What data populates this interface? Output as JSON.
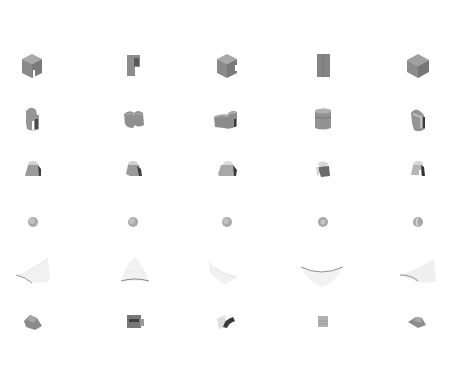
{
  "grid": {
    "rows": 6,
    "columns": 5,
    "column_centers": [
      32,
      133,
      227,
      323,
      418
    ],
    "row_centers": [
      66,
      120,
      170,
      222,
      272,
      322
    ],
    "background": "#ffffff"
  },
  "rows": [
    {
      "name": "notched-cube",
      "cells": [
        {
          "shape": "cube-notch",
          "view": "iso-left"
        },
        {
          "shape": "slab-notch",
          "view": "front"
        },
        {
          "shape": "cube-notch",
          "view": "iso-right"
        },
        {
          "shape": "slab",
          "view": "front-flat"
        },
        {
          "shape": "cube",
          "view": "iso"
        }
      ]
    },
    {
      "name": "rounded-block",
      "cells": [
        {
          "shape": "rounded-notch",
          "view": "side"
        },
        {
          "shape": "rounded-bowl",
          "view": "top"
        },
        {
          "shape": "rounded-wide",
          "view": "iso"
        },
        {
          "shape": "cylinder-block",
          "view": "front"
        },
        {
          "shape": "rounded-notch",
          "view": "side-right"
        }
      ]
    },
    {
      "name": "frustum-cap",
      "cells": [
        {
          "shape": "cap",
          "view": "left"
        },
        {
          "shape": "cap",
          "view": "front"
        },
        {
          "shape": "cap",
          "view": "right"
        },
        {
          "shape": "cap-dark",
          "view": "back"
        },
        {
          "shape": "cap",
          "view": "open"
        }
      ]
    },
    {
      "name": "sphere",
      "cells": [
        {
          "shape": "sphere"
        },
        {
          "shape": "sphere"
        },
        {
          "shape": "sphere"
        },
        {
          "shape": "sphere"
        },
        {
          "shape": "sphere-crescent"
        }
      ]
    },
    {
      "name": "point-cloud-sheet",
      "cells": [
        {
          "shape": "sheet",
          "view": "left"
        },
        {
          "shape": "sheet",
          "view": "front"
        },
        {
          "shape": "sheet",
          "view": "right"
        },
        {
          "shape": "sheet",
          "view": "bottom"
        },
        {
          "shape": "sheet",
          "view": "left-2"
        }
      ]
    },
    {
      "name": "small-block",
      "cells": [
        {
          "shape": "wedge",
          "view": "iso"
        },
        {
          "shape": "box-dark",
          "view": "front"
        },
        {
          "shape": "curved-dark",
          "view": "side"
        },
        {
          "shape": "small-cube",
          "view": "front"
        },
        {
          "shape": "wedge-flat",
          "view": "iso"
        }
      ]
    }
  ],
  "colors": {
    "light": "#b8b8b8",
    "mid": "#8c8c8c",
    "dark": "#5a5a5a",
    "darkest": "#3a3a3a",
    "cloud": "#cfcfcf"
  }
}
